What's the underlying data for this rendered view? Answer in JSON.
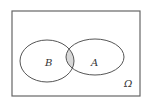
{
  "diagram": {
    "type": "venn",
    "universe_label": "Ω",
    "sets": [
      {
        "name": "B",
        "label": "B"
      },
      {
        "name": "A",
        "label": "A"
      }
    ],
    "shaded_region": "A ∩ B",
    "colors": {
      "stroke": "#555555",
      "shade": "#d8d8d8",
      "background": "#ffffff"
    }
  }
}
